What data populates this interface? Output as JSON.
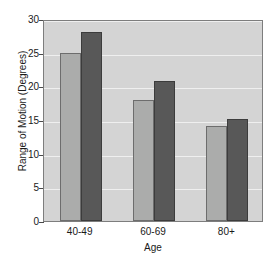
{
  "chart_data": {
    "type": "bar",
    "title": "",
    "xlabel": "Age",
    "ylabel": "Range of Motion (Degrees)",
    "categories": [
      "40-49",
      "60-69",
      "80+"
    ],
    "series": [
      {
        "name": "series-a",
        "color": "#abacab",
        "values": [
          25.0,
          18.0,
          14.1
        ]
      },
      {
        "name": "series-b",
        "color": "#585858",
        "values": [
          28.1,
          20.8,
          15.1
        ]
      }
    ],
    "ylim": [
      0,
      30
    ],
    "yticks": [
      0,
      5,
      10,
      15,
      20,
      25,
      30
    ],
    "ytick_labels": [
      "0",
      "5",
      "10",
      "15",
      "20",
      "25",
      "30"
    ],
    "grid": true,
    "grid_color": "#efefef",
    "legend": false,
    "legend_position": "none",
    "plot_background": "#d4d4d4",
    "page_background": "#ffffff",
    "axis_color": "#4a4a4a"
  }
}
